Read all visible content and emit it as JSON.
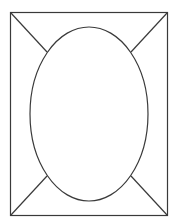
{
  "diagram": {
    "stroke_color": "#3a3a3a",
    "background_color": "#ffffff",
    "shapes": [
      "rectangle-frame",
      "oval",
      "diagonal-top-left",
      "diagonal-top-right",
      "diagonal-bottom-left",
      "diagonal-bottom-right"
    ]
  }
}
